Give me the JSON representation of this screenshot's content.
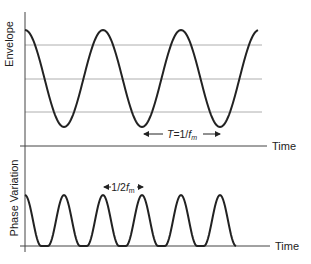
{
  "top_panel": {
    "ylabel": "Envelope",
    "xlabel": "Time",
    "annotation": {
      "prefix": "T=1/",
      "var": "f",
      "sub": "m"
    },
    "gridlines": 3
  },
  "bottom_panel": {
    "ylabel": "Phase Variation",
    "xlabel": "Time",
    "annotation": {
      "prefix": "1/2",
      "var": "f",
      "sub": "m"
    }
  },
  "colors": {
    "curve": "#222222",
    "axis": "#444444",
    "grid": "#9a9a9a"
  },
  "chart_data": [
    {
      "type": "line",
      "title": "",
      "ylabel": "Envelope",
      "xlabel": "Time",
      "description": "Sinusoidal envelope starting at peak, ~3 periods shown; 3 horizontal reference lines",
      "periods_shown": 3,
      "annotation": "T=1/f_m",
      "grid": true
    },
    {
      "type": "line",
      "title": "",
      "ylabel": "Phase Variation",
      "xlabel": "Time",
      "description": "Rectified-cosine-like pulses at twice the envelope rate; 6 pulses (first is half)",
      "pulses_shown": 6,
      "annotation": "1/2f_m",
      "grid": false
    }
  ]
}
